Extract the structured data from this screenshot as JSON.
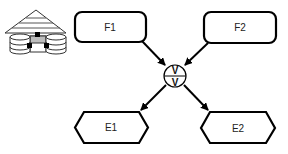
{
  "diagram": {
    "type": "event-driven process chain",
    "icon": {
      "name": "data-warehouse-icon"
    },
    "functions": [
      {
        "id": "F1",
        "label": "F1",
        "shape": "rounded-rect"
      },
      {
        "id": "F2",
        "label": "F2",
        "shape": "rounded-rect"
      }
    ],
    "connector": {
      "id": "AND",
      "top_symbol": "V",
      "bottom_symbol": "V",
      "shape": "circle"
    },
    "events": [
      {
        "id": "E1",
        "label": "E1",
        "shape": "hexagon"
      },
      {
        "id": "E2",
        "label": "E2",
        "shape": "hexagon"
      }
    ],
    "edges": [
      {
        "from": "F1",
        "to": "AND"
      },
      {
        "from": "F2",
        "to": "AND"
      },
      {
        "from": "AND",
        "to": "E1"
      },
      {
        "from": "AND",
        "to": "E2"
      }
    ],
    "colors": {
      "stroke": "#000000",
      "background": "#ffffff",
      "icon_gray": "#bdbdbd"
    }
  }
}
